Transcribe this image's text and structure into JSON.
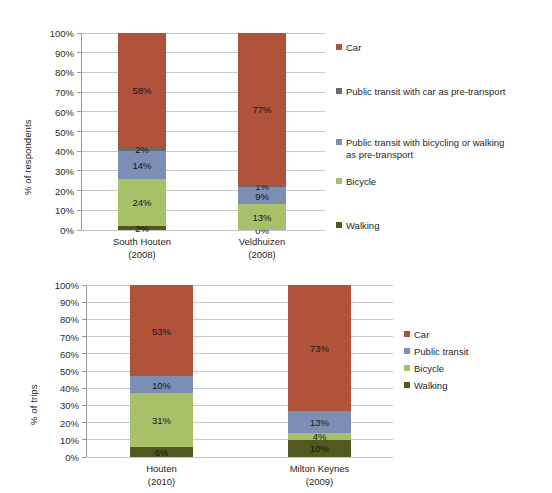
{
  "colors": {
    "car": "#B1523A",
    "transit_car_pre": "#6B6B6B",
    "transit_bike_pre": "#7B8FB5",
    "public_transit": "#7B8FB5",
    "bicycle": "#A8C06A",
    "walking": "#51591F",
    "gridline": "#C8C8C8",
    "axis": "#9A9A9A",
    "text": "#1F1F1F"
  },
  "chart_data": [
    {
      "id": "chart-top",
      "type": "bar",
      "stacked": true,
      "percent": true,
      "title": "",
      "xlabel": "",
      "ylabel": "% of respondents",
      "ylim": [
        0,
        100
      ],
      "yticks": [
        "0%",
        "10%",
        "20%",
        "30%",
        "40%",
        "50%",
        "60%",
        "70%",
        "80%",
        "90%",
        "100%"
      ],
      "ytick_values": [
        0,
        10,
        20,
        30,
        40,
        50,
        60,
        70,
        80,
        90,
        100
      ],
      "grid": true,
      "legend_position": "right",
      "categories": [
        "South Houten",
        "Veldhuizen"
      ],
      "category_sublabels": [
        "(2008)",
        "(2008)"
      ],
      "series": [
        {
          "name": "Walking",
          "color_key": "walking",
          "values": [
            2,
            0
          ],
          "labels": [
            "2%",
            "0%"
          ]
        },
        {
          "name": "Bicycle",
          "color_key": "bicycle",
          "values": [
            24,
            13
          ],
          "labels": [
            "24%",
            "13%"
          ]
        },
        {
          "name": "Public transit with bicycling or walking as pre-transport",
          "color_key": "transit_bike_pre",
          "values": [
            14,
            9
          ],
          "labels": [
            "14%",
            "9%"
          ]
        },
        {
          "name": "Public transit with car as pre-transport",
          "color_key": "transit_car_pre",
          "values": [
            2,
            1
          ],
          "labels": [
            "2%",
            "1%"
          ]
        },
        {
          "name": "Car",
          "color_key": "car",
          "values": [
            58,
            77
          ],
          "labels": [
            "58%",
            "77%"
          ]
        }
      ],
      "legend_items": [
        {
          "label": "Car",
          "color_key": "car"
        },
        {
          "label": "Public transit with car as pre-transport",
          "color_key": "transit_car_pre"
        },
        {
          "label": "Public transit with bicycling or walking\nas pre-transport",
          "color_key": "transit_bike_pre"
        },
        {
          "label": "Bicycle",
          "color_key": "bicycle"
        },
        {
          "label": "Walking",
          "color_key": "walking"
        }
      ]
    },
    {
      "id": "chart-bottom",
      "type": "bar",
      "stacked": true,
      "percent": true,
      "title": "",
      "xlabel": "",
      "ylabel": "% of trips",
      "ylim": [
        0,
        100
      ],
      "yticks": [
        "0%",
        "10%",
        "20%",
        "30%",
        "40%",
        "50%",
        "60%",
        "70%",
        "80%",
        "90%",
        "100%"
      ],
      "ytick_values": [
        0,
        10,
        20,
        30,
        40,
        50,
        60,
        70,
        80,
        90,
        100
      ],
      "grid": true,
      "legend_position": "right",
      "categories": [
        "Houten",
        "Milton Keynes"
      ],
      "category_sublabels": [
        "(2010)",
        "(2009)"
      ],
      "series": [
        {
          "name": "Walking",
          "color_key": "walking",
          "values": [
            6,
            10
          ],
          "labels": [
            "6%",
            "10%"
          ]
        },
        {
          "name": "Bicycle",
          "color_key": "bicycle",
          "values": [
            31,
            4
          ],
          "labels": [
            "31%",
            "4%"
          ]
        },
        {
          "name": "Public transit",
          "color_key": "public_transit",
          "values": [
            10,
            13
          ],
          "labels": [
            "10%",
            "13%"
          ]
        },
        {
          "name": "Car",
          "color_key": "car",
          "values": [
            53,
            73
          ],
          "labels": [
            "53%",
            "73%"
          ]
        }
      ],
      "legend_items": [
        {
          "label": "Car",
          "color_key": "car"
        },
        {
          "label": "Public transit",
          "color_key": "public_transit"
        },
        {
          "label": "Bicycle",
          "color_key": "bicycle"
        },
        {
          "label": "Walking",
          "color_key": "walking"
        }
      ]
    }
  ]
}
